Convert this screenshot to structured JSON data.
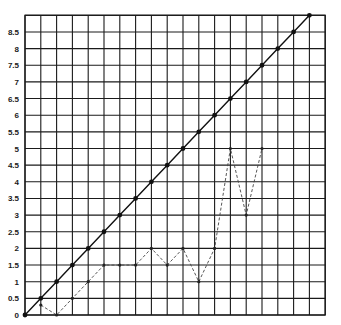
{
  "chart_data": {
    "type": "line",
    "title": "",
    "xlabel": "",
    "ylabel": "",
    "xlim": [
      0,
      9.5
    ],
    "ylim": [
      0,
      9
    ],
    "grid": true,
    "y_ticks": [
      "0",
      "0.5",
      "1",
      "1.5",
      "2",
      "2.5",
      "3",
      "3.5",
      "4",
      "4.5",
      "5",
      "5.5",
      "6",
      "6.5",
      "7",
      "7.5",
      "8",
      "8.5"
    ],
    "legend": null,
    "series": [
      {
        "name": "diagonal (solid)",
        "style": "solid",
        "x": [
          0,
          0.5,
          1,
          1.5,
          2,
          2.5,
          3,
          3.5,
          4,
          4.5,
          5,
          5.5,
          6,
          6.5,
          7,
          7.5,
          8,
          8.5,
          9
        ],
        "y": [
          0,
          0.5,
          1,
          1.5,
          2,
          2.5,
          3,
          3.5,
          4,
          4.5,
          5,
          5.5,
          6,
          6.5,
          7,
          7.5,
          8,
          8.5,
          9
        ]
      },
      {
        "name": "observed (dashed)",
        "style": "dashed",
        "x": [
          0.5,
          1,
          1.5,
          2,
          2.5,
          3,
          3.5,
          4,
          4.5,
          5,
          5.5,
          6,
          6.5,
          7,
          7.5
        ],
        "y": [
          0.3,
          0,
          0.5,
          1,
          1.5,
          1.5,
          1.5,
          2,
          1.5,
          2,
          1,
          2,
          5,
          3,
          5
        ]
      }
    ]
  },
  "layout": {
    "x0": 25,
    "y0": 315,
    "px_per_unit_x": 31.6,
    "px_per_unit_y": 33.3,
    "cols": 19,
    "rows": 18
  }
}
